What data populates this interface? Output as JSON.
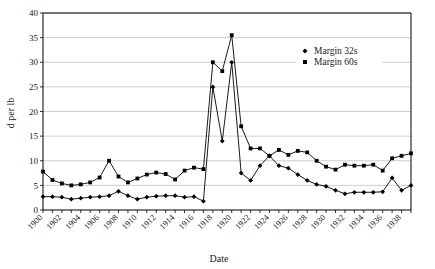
{
  "chart_data": {
    "type": "line",
    "title": "",
    "xlabel": "Date",
    "ylabel": "d per lb",
    "xlim": [
      1900,
      1939
    ],
    "ylim": [
      0,
      40
    ],
    "ytick_step": 5,
    "yticks": [
      0,
      5,
      10,
      15,
      20,
      25,
      30,
      35,
      40
    ],
    "xticks_labeled": [
      1900,
      1902,
      1904,
      1906,
      1908,
      1910,
      1912,
      1914,
      1916,
      1918,
      1920,
      1922,
      1924,
      1926,
      1928,
      1930,
      1932,
      1934,
      1936,
      1938
    ],
    "x": [
      1900,
      1901,
      1902,
      1903,
      1904,
      1905,
      1906,
      1907,
      1908,
      1909,
      1910,
      1911,
      1912,
      1913,
      1914,
      1915,
      1916,
      1917,
      1918,
      1919,
      1920,
      1921,
      1922,
      1923,
      1924,
      1925,
      1926,
      1927,
      1928,
      1929,
      1930,
      1931,
      1932,
      1933,
      1934,
      1935,
      1936,
      1937,
      1938,
      1939
    ],
    "grid": true,
    "legend_position": "upper-right",
    "series": [
      {
        "name": "Margin 32s",
        "marker": "diamond",
        "color": "#000000",
        "values": [
          2.7,
          2.7,
          2.6,
          2.2,
          2.4,
          2.6,
          2.7,
          2.9,
          3.8,
          2.9,
          2.2,
          2.6,
          2.8,
          2.9,
          2.9,
          2.6,
          2.7,
          1.8,
          25.0,
          14.0,
          30.0,
          7.5,
          6.0,
          9.0,
          11.0,
          9.0,
          8.5,
          7.2,
          6.0,
          5.2,
          4.8,
          4.0,
          3.3,
          3.6,
          3.6,
          3.6,
          3.7,
          6.5,
          4.0,
          5.0
        ]
      },
      {
        "name": "Margin 60s",
        "marker": "square",
        "color": "#000000",
        "values": [
          7.8,
          6.1,
          5.4,
          5.0,
          5.2,
          5.6,
          6.6,
          10.0,
          6.8,
          5.6,
          6.4,
          7.2,
          7.6,
          7.3,
          6.2,
          8.0,
          8.6,
          8.3,
          30.0,
          28.2,
          35.5,
          17.0,
          12.5,
          12.5,
          11.0,
          12.2,
          11.2,
          12.0,
          11.7,
          10.0,
          8.8,
          8.2,
          9.2,
          9.0,
          9.0,
          9.2,
          8.0,
          10.5,
          11.0,
          11.5
        ]
      }
    ]
  },
  "legend": {
    "entries": [
      {
        "label": "Margin 32s",
        "marker": "diamond"
      },
      {
        "label": "Margin 60s",
        "marker": "square"
      }
    ]
  }
}
